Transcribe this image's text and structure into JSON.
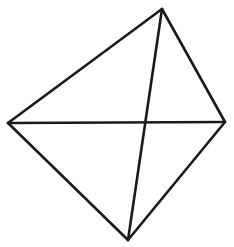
{
  "figure": {
    "name": "quadrilateral-with-diagonals",
    "canvas": {
      "width": 234,
      "height": 247,
      "background_color": "#ffffff"
    },
    "style": {
      "stroke_color": "#1a1a1a",
      "stroke_width": 2.6,
      "stroke_linecap": "round",
      "stroke_linejoin": "round",
      "fill": "none"
    },
    "vertices": [
      {
        "id": "top",
        "label": "top vertex",
        "x": 162,
        "y": 9
      },
      {
        "id": "right",
        "label": "right vertex",
        "x": 225,
        "y": 122
      },
      {
        "id": "bottom",
        "label": "bottom vertex",
        "x": 128,
        "y": 240
      },
      {
        "id": "left",
        "label": "left vertex",
        "x": 8,
        "y": 123
      }
    ],
    "intersection": {
      "id": "center",
      "label": "diagonal intersection",
      "x": 147,
      "y": 123
    },
    "edges": [
      {
        "id": "edge-top-right",
        "label": "upper right edge",
        "from": "top",
        "to": "right",
        "x1": 162,
        "y1": 9,
        "x2": 225,
        "y2": 122
      },
      {
        "id": "edge-right-bottom",
        "label": "lower right edge",
        "from": "right",
        "to": "bottom",
        "x1": 225,
        "y1": 122,
        "x2": 128,
        "y2": 240
      },
      {
        "id": "edge-bottom-left",
        "label": "lower left edge",
        "from": "bottom",
        "to": "left",
        "x1": 128,
        "y1": 240,
        "x2": 8,
        "y2": 123
      },
      {
        "id": "edge-left-top",
        "label": "upper left edge",
        "from": "left",
        "to": "top",
        "x1": 8,
        "y1": 123,
        "x2": 162,
        "y2": 9
      }
    ],
    "diagonals": [
      {
        "id": "diagonal-horizontal",
        "label": "horizontal diagonal",
        "from": "left",
        "to": "right",
        "x1": 8,
        "y1": 123,
        "x2": 225,
        "y2": 122
      },
      {
        "id": "diagonal-vertical",
        "label": "vertical diagonal",
        "from": "top",
        "to": "bottom",
        "x1": 162,
        "y1": 9,
        "x2": 128,
        "y2": 240
      }
    ]
  }
}
